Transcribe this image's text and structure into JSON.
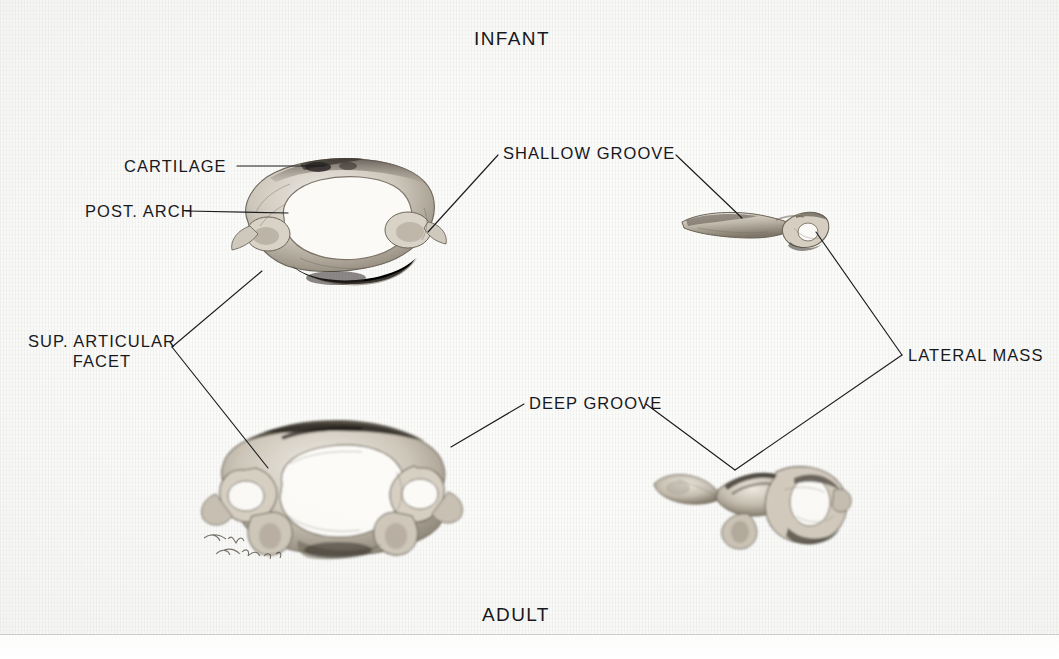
{
  "plate": {
    "title": "Comparison of infant and adult atlas (C1) vertebrae",
    "medium": "graphite pencil drawing on textured paper",
    "signature": "Tom Ranske '7?"
  },
  "captions": {
    "top": "INFANT",
    "bottom": "ADULT"
  },
  "callouts": {
    "cartilage": "CARTILAGE",
    "post_arch": "POST. ARCH",
    "sup_articular_facet_line1": "SUP. ARTICULAR",
    "sup_articular_facet_line2": "FACET",
    "shallow_groove": "SHALLOW GROOVE",
    "deep_groove": "DEEP GROOVE",
    "lateral_mass": "LATERAL MASS"
  },
  "specimens": {
    "infant_superior": "infant atlas, superior view",
    "adult_superior": "adult atlas, superior view",
    "infant_lateral": "infant lateral mass, lateral view",
    "adult_lateral": "adult lateral mass, lateral view"
  },
  "colors": {
    "paper": "#fbfbf9",
    "ink": "#18181c",
    "bone_light": "#ded9d0",
    "bone_mid": "#a89f92",
    "bone_dark": "#4a443c",
    "bone_shadow": "#2b2721"
  }
}
